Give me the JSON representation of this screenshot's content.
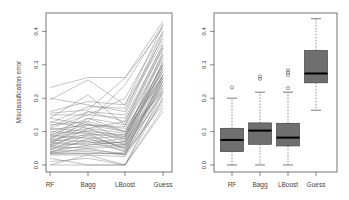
{
  "chart_data": [
    {
      "type": "line",
      "title": "",
      "xlabel": "",
      "ylabel": "Misclassification error",
      "categories": [
        "RF",
        "Bagg",
        "LBoost",
        "Guess"
      ],
      "yticks": [
        "0.0",
        "0.1",
        "0.2",
        "0.3",
        "0.4"
      ],
      "ylim": [
        0,
        0.43
      ],
      "grid": false,
      "legend": "none",
      "line_color": "#7a7a7a",
      "note": "Parallel-coordinates plot: each line is one dataset's misclassification error across four methods (approx. 100 lines; representative sample below).",
      "series": [
        {
          "name": "d1",
          "values": [
            0.232,
            0.262,
            0.262,
            0.43
          ]
        },
        {
          "name": "d2",
          "values": [
            0.2,
            0.18,
            0.16,
            0.4
          ]
        },
        {
          "name": "d3",
          "values": [
            0.195,
            0.255,
            0.18,
            0.42
          ]
        },
        {
          "name": "d4",
          "values": [
            0.16,
            0.19,
            0.18,
            0.38
          ]
        },
        {
          "name": "d5",
          "values": [
            0.155,
            0.165,
            0.26,
            0.41
          ]
        },
        {
          "name": "d6",
          "values": [
            0.15,
            0.15,
            0.14,
            0.36
          ]
        },
        {
          "name": "d7",
          "values": [
            0.14,
            0.21,
            0.12,
            0.33
          ]
        },
        {
          "name": "d8",
          "values": [
            0.13,
            0.11,
            0.13,
            0.35
          ]
        },
        {
          "name": "d9",
          "values": [
            0.12,
            0.13,
            0.1,
            0.3
          ]
        },
        {
          "name": "d10",
          "values": [
            0.115,
            0.16,
            0.15,
            0.39
          ]
        },
        {
          "name": "d11",
          "values": [
            0.11,
            0.1,
            0.09,
            0.28
          ]
        },
        {
          "name": "d12",
          "values": [
            0.105,
            0.12,
            0.115,
            0.32
          ]
        },
        {
          "name": "d13",
          "values": [
            0.1,
            0.095,
            0.08,
            0.27
          ]
        },
        {
          "name": "d14",
          "values": [
            0.095,
            0.14,
            0.1,
            0.26
          ]
        },
        {
          "name": "d15",
          "values": [
            0.09,
            0.11,
            0.07,
            0.25
          ]
        },
        {
          "name": "d16",
          "values": [
            0.088,
            0.08,
            0.085,
            0.29
          ]
        },
        {
          "name": "d17",
          "values": [
            0.085,
            0.1,
            0.06,
            0.24
          ]
        },
        {
          "name": "d18",
          "values": [
            0.08,
            0.125,
            0.075,
            0.31
          ]
        },
        {
          "name": "d19",
          "values": [
            0.078,
            0.09,
            0.09,
            0.22
          ]
        },
        {
          "name": "d20",
          "values": [
            0.075,
            0.07,
            0.06,
            0.27
          ]
        },
        {
          "name": "d21",
          "values": [
            0.072,
            0.105,
            0.085,
            0.34
          ]
        },
        {
          "name": "d22",
          "values": [
            0.07,
            0.085,
            0.05,
            0.26
          ]
        },
        {
          "name": "d23",
          "values": [
            0.068,
            0.06,
            0.07,
            0.23
          ]
        },
        {
          "name": "d24",
          "values": [
            0.065,
            0.12,
            0.11,
            0.28
          ]
        },
        {
          "name": "d25",
          "values": [
            0.062,
            0.075,
            0.065,
            0.3
          ]
        },
        {
          "name": "d26",
          "values": [
            0.06,
            0.095,
            0.045,
            0.25
          ]
        },
        {
          "name": "d27",
          "values": [
            0.058,
            0.065,
            0.08,
            0.33
          ]
        },
        {
          "name": "d28",
          "values": [
            0.055,
            0.05,
            0.055,
            0.21
          ]
        },
        {
          "name": "d29",
          "values": [
            0.052,
            0.11,
            0.095,
            0.27
          ]
        },
        {
          "name": "d30",
          "values": [
            0.05,
            0.07,
            0.04,
            0.24
          ]
        },
        {
          "name": "d31",
          "values": [
            0.048,
            0.055,
            0.06,
            0.29
          ]
        },
        {
          "name": "d32",
          "values": [
            0.045,
            0.09,
            0.05,
            0.26
          ]
        },
        {
          "name": "d33",
          "values": [
            0.042,
            0.045,
            0.035,
            0.22
          ]
        },
        {
          "name": "d34",
          "values": [
            0.04,
            0.06,
            0.07,
            0.31
          ]
        },
        {
          "name": "d35",
          "values": [
            0.038,
            0.04,
            0.03,
            0.2
          ]
        },
        {
          "name": "d36",
          "values": [
            0.036,
            0.08,
            0.04,
            0.25
          ]
        },
        {
          "name": "d37",
          "values": [
            0.035,
            0.035,
            0.035,
            0.18
          ]
        },
        {
          "name": "d38",
          "values": [
            0.034,
            0.05,
            0.03,
            0.23
          ]
        },
        {
          "name": "d39",
          "values": [
            0.033,
            0.034,
            0.034,
            0.27
          ]
        },
        {
          "name": "d40",
          "values": [
            0.03,
            0.03,
            0.025,
            0.19
          ]
        },
        {
          "name": "d41",
          "values": [
            0.02,
            0.0,
            0.0,
            0.17
          ]
        },
        {
          "name": "d42",
          "values": [
            0.0,
            0.03,
            0.0,
            0.16
          ]
        },
        {
          "name": "d43",
          "values": [
            0.0,
            0.0,
            0.0,
            0.2
          ]
        },
        {
          "name": "d44",
          "values": [
            0.01,
            0.02,
            0.0,
            0.22
          ]
        },
        {
          "name": "d45",
          "values": [
            0.125,
            0.175,
            0.17,
            0.37
          ]
        },
        {
          "name": "d46",
          "values": [
            0.11,
            0.15,
            0.2,
            0.4
          ]
        },
        {
          "name": "d47",
          "values": [
            0.09,
            0.13,
            0.24,
            0.42
          ]
        },
        {
          "name": "d48",
          "values": [
            0.075,
            0.16,
            0.13,
            0.36
          ]
        },
        {
          "name": "d49",
          "values": [
            0.06,
            0.14,
            0.12,
            0.35
          ]
        },
        {
          "name": "d50",
          "values": [
            0.14,
            0.12,
            0.1,
            0.3
          ]
        }
      ]
    },
    {
      "type": "box",
      "title": "",
      "xlabel": "",
      "ylabel": "",
      "categories": [
        "RF",
        "Bagg",
        "LBoost",
        "Guess"
      ],
      "yticks": [
        "0.0",
        "0.1",
        "0.2",
        "0.3",
        "0.4"
      ],
      "ylim": [
        0,
        0.43
      ],
      "grid": false,
      "legend": "none",
      "box_color": "#6f6f6f",
      "median_color": "#000000",
      "series": [
        {
          "name": "RF",
          "whisker_low": 0.0,
          "q1": 0.04,
          "median": 0.075,
          "q3": 0.11,
          "whisker_high": 0.2,
          "outliers": [
            0.232
          ]
        },
        {
          "name": "Bagg",
          "whisker_low": 0.0,
          "q1": 0.062,
          "median": 0.103,
          "q3": 0.126,
          "whisker_high": 0.218,
          "outliers": [
            0.258,
            0.265
          ]
        },
        {
          "name": "LBoost",
          "whisker_low": 0.0,
          "q1": 0.057,
          "median": 0.082,
          "q3": 0.125,
          "whisker_high": 0.218,
          "outliers": [
            0.23,
            0.27,
            0.277,
            0.284
          ]
        },
        {
          "name": "Guess",
          "whisker_low": 0.164,
          "q1": 0.246,
          "median": 0.274,
          "q3": 0.343,
          "whisker_high": 0.438,
          "outliers": []
        }
      ]
    }
  ]
}
